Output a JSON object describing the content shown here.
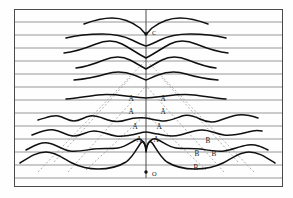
{
  "figure": {
    "title": "",
    "background_color": "#fefefe",
    "frame": {
      "x": 14.5,
      "y": 9.5,
      "width": 268,
      "height": 177,
      "stroke_color": "#4a4a4a",
      "stroke_width": 1.0
    },
    "grid": {
      "type": "horizontal-rules",
      "stroke_color": "#7d7d7d",
      "stroke_width": 0.8,
      "count": 13,
      "y_values": [
        22,
        35,
        48,
        61,
        74,
        87,
        100,
        113,
        126,
        139,
        152,
        165,
        178
      ]
    },
    "axis": {
      "vertical_line": {
        "x": 146,
        "y_top": 9.5,
        "y_bottom": 178,
        "stroke_color": "#3a3a3a",
        "stroke_width": 0.9
      }
    },
    "markers": [
      {
        "name": "point-c",
        "label": "C",
        "x": 146,
        "y": 34,
        "label_dx": 6,
        "label_dy": 0,
        "dot_radius": 1.7,
        "color": "#111111"
      },
      {
        "name": "point-o",
        "label": "O",
        "x": 146,
        "y": 172,
        "label_dx": 6,
        "label_dy": 3,
        "dot_radius": 1.7,
        "color": "#111111"
      }
    ],
    "curve_color": "#101010",
    "curve_stroke_width": 1.5,
    "dashed_color": "#9a9a9a",
    "dashed_stroke_width": 0.8,
    "dash_pattern": "2,2",
    "labels": [
      {
        "name": "label-a-1-left",
        "text": "A",
        "x": 131,
        "y": 99
      },
      {
        "name": "label-a-1-right",
        "text": "A",
        "x": 163,
        "y": 99
      },
      {
        "name": "label-a-2-left",
        "text": "A",
        "x": 131,
        "y": 112
      },
      {
        "name": "label-a-2-right",
        "text": "A",
        "x": 163,
        "y": 112
      },
      {
        "name": "label-a-3-left",
        "text": "A",
        "x": 135,
        "y": 127
      },
      {
        "name": "label-a-3-right",
        "text": "A",
        "x": 159,
        "y": 127
      },
      {
        "name": "label-a-4-left",
        "text": "A",
        "x": 139,
        "y": 140
      },
      {
        "name": "label-a-4-right",
        "text": "A",
        "x": 156,
        "y": 140
      },
      {
        "name": "label-b-1",
        "text": "B",
        "x": 208,
        "y": 141
      },
      {
        "name": "label-b-2-left",
        "text": "B",
        "x": 197,
        "y": 154
      },
      {
        "name": "label-b-2-right",
        "text": "B",
        "x": 214,
        "y": 154
      },
      {
        "name": "label-b-3",
        "text": "B",
        "x": 196,
        "y": 168
      }
    ],
    "curves": [
      {
        "name": "curve-row-1",
        "d": "M 84 24 C 92 21 100 18 112 18 C 124 18 132 22 140 28 C 143 31 144 33 146 34 C 148 33 149 31 152 28 C 160 22 168 18 180 18 C 192 18 200 21 208 24"
      },
      {
        "name": "curve-row-2",
        "d": "M 66 38 C 78 35 90 34 102 34 C 114 34 124 36 132 40 C 138 43 142 45 146 46 C 150 45 154 43 160 40 C 168 36 178 34 190 34 C 202 34 214 35 226 38"
      },
      {
        "name": "curve-row-3",
        "d": "M 64 53 C 76 52 86 48 96 44 C 106 40 114 40 122 44 C 130 48 138 54 146 58 C 154 54 162 48 170 44 C 178 40 186 40 196 44 C 206 48 216 52 228 53"
      },
      {
        "name": "curve-row-4",
        "d": "M 76 68 C 86 67 94 64 104 60 C 114 56 122 56 130 60 C 138 64 142 67 146 69 C 150 67 154 64 162 60 C 170 56 178 56 188 60 C 198 64 206 67 216 68"
      },
      {
        "name": "curve-row-5",
        "d": "M 74 80 C 86 79 96 77 106 74 C 116 71 126 72 134 75 C 140 77 143 79 146 80 C 149 79 152 77 158 75 C 166 72 176 71 186 74 C 196 77 206 79 218 80"
      },
      {
        "name": "curve-row-6",
        "d": "M 66 99 C 78 98 88 96 98 95 C 108 94 118 95 126 96 C 134 97 140 98 146 98 C 152 98 158 97 166 96 C 174 95 184 94 194 95 C 204 96 214 98 226 99"
      },
      {
        "name": "curve-row-7",
        "d": "M 38 120 C 46 118 52 115 58 116 C 64 117 68 121 74 121 C 80 121 84 117 90 116 C 96 115 102 118 108 120 C 114 122 120 122 126 120 C 132 118 138 117 146 118 C 152 119 158 121 164 121 C 170 121 176 118 182 116 C 188 114 194 116 200 119 C 206 122 212 123 218 121 C 224 119 230 116 238 115 C 246 114 252 116 258 118"
      },
      {
        "name": "curve-row-8",
        "d": "M 32 135 C 40 132 46 129 54 130 C 62 131 66 136 74 136 C 82 136 86 131 94 131 C 102 131 108 135 116 136 C 124 137 132 135 140 133 C 143 132 145 132 146 132 C 148 132 152 133 158 134 C 166 136 172 137 180 135 C 188 133 194 130 202 130 C 210 130 216 134 224 135 C 232 136 240 134 248 132 C 254 130 258 130 262 131"
      },
      {
        "name": "curve-row-9",
        "d": "M 26 150 C 34 146 40 142 48 143 C 56 144 62 150 70 151 C 78 152 86 150 94 149 C 102 148 110 149 118 148 C 126 147 132 141 138 139 C 142 138 144 142 146 148 C 148 142 152 138 156 139 C 162 141 168 147 176 148 C 184 149 192 148 200 149 C 208 150 216 152 224 151 C 232 150 240 146 248 145 C 256 144 262 147 268 150"
      },
      {
        "name": "curve-row-10",
        "d": "M 20 163 C 28 158 36 152 46 152 C 56 152 64 159 72 163 C 80 167 88 169 98 169 C 108 169 118 167 126 162 C 132 158 136 150 140 144 C 143 140 145 140 146 152 M 146 152 C 148 140 150 140 153 144 C 157 150 161 158 167 162 C 175 167 185 169 195 169 C 205 169 215 167 223 163 C 231 159 239 152 249 152 C 259 152 267 158 275 163"
      }
    ],
    "dashed_lines": [
      {
        "name": "dashed-left-outer",
        "d": "M 38 172 L 146 60"
      },
      {
        "name": "dashed-left-inner",
        "d": "M 68 172 L 146 86"
      },
      {
        "name": "dashed-left-mid",
        "d": "M 54 162 L 130 78"
      },
      {
        "name": "dashed-right-outer",
        "d": "M 254 172 L 146 60"
      },
      {
        "name": "dashed-right-inner",
        "d": "M 224 172 L 146 86"
      },
      {
        "name": "dashed-right-mid",
        "d": "M 238 162 L 162 78"
      },
      {
        "name": "dashed-left-lower",
        "d": "M 86 170 L 146 114"
      },
      {
        "name": "dashed-right-lower",
        "d": "M 206 170 L 146 114"
      }
    ]
  }
}
